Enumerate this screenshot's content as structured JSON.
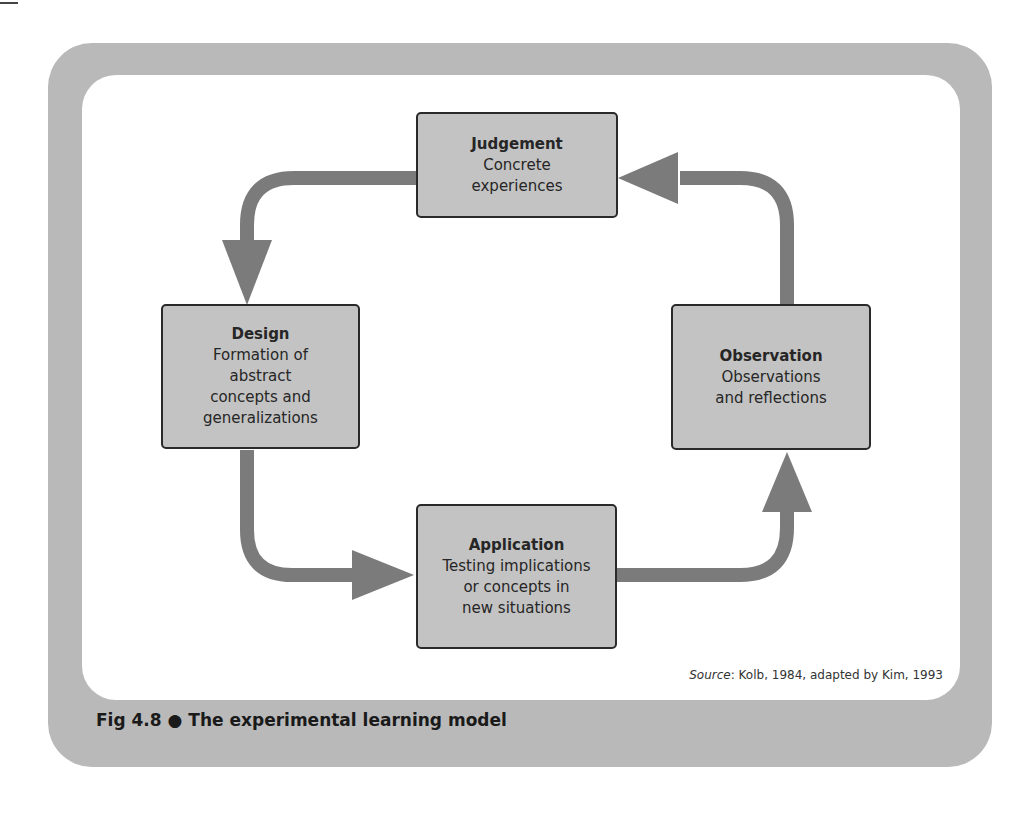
{
  "figure": {
    "caption_number": "Fig 4.8",
    "caption_bullet": "●",
    "caption_title": "The experimental learning model",
    "source_label": "Source",
    "source_text": ": Kolb, 1984, adapted by Kim, 1993"
  },
  "nodes": {
    "judgement": {
      "title": "Judgement",
      "desc": "Concrete\nexperiences"
    },
    "design": {
      "title": "Design",
      "desc": "Formation of\nabstract\nconcepts and\ngeneralizations"
    },
    "observation": {
      "title": "Observation",
      "desc": "Observations\nand reflections"
    },
    "application": {
      "title": "Application",
      "desc": "Testing implications\nor concepts in\nnew situations"
    }
  },
  "cycle": [
    "Judgement",
    "Design",
    "Application",
    "Observation"
  ],
  "colors": {
    "frame": "#b9b9b9",
    "node_fill": "#c3c3c3",
    "node_border": "#2a2a2a",
    "arrow": "#7b7b7b"
  }
}
